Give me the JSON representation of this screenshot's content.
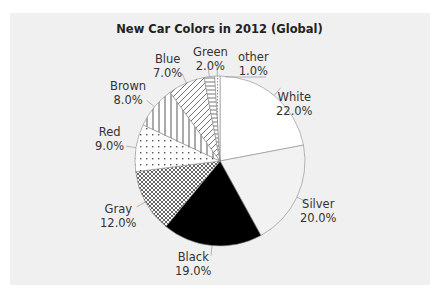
{
  "chart_data": {
    "type": "pie",
    "title": "New Car Colors in 2012 (Global)",
    "categories": [
      "White",
      "Silver",
      "Black",
      "Gray",
      "Red",
      "Brown",
      "Blue",
      "Green",
      "other"
    ],
    "values": [
      22.0,
      20.0,
      19.0,
      12.0,
      9.0,
      8.0,
      7.0,
      2.0,
      1.0
    ],
    "value_labels": [
      "22.0%",
      "20.0%",
      "19.0%",
      "12.0%",
      "9.0%",
      "8.0%",
      "7.0%",
      "2.0%",
      "1.0%"
    ],
    "start_angle": "12 o'clock, clockwise",
    "fills": [
      "white",
      "light gray",
      "black",
      "crosshatch",
      "dots",
      "vertical lines",
      "diagonal lines",
      "horizontal lines",
      "fine dashes"
    ],
    "legend": "none (data labels outside slices)",
    "grid": false
  },
  "labels": {
    "white": {
      "name": "White",
      "pct": "22.0%"
    },
    "silver": {
      "name": "Silver",
      "pct": "20.0%"
    },
    "black": {
      "name": "Black",
      "pct": "19.0%"
    },
    "gray": {
      "name": "Gray",
      "pct": "12.0%"
    },
    "red": {
      "name": "Red",
      "pct": "9.0%"
    },
    "brown": {
      "name": "Brown",
      "pct": "8.0%"
    },
    "blue": {
      "name": "Blue",
      "pct": "7.0%"
    },
    "green": {
      "name": "Green",
      "pct": "2.0%"
    },
    "other": {
      "name": "other",
      "pct": "1.0%"
    }
  }
}
